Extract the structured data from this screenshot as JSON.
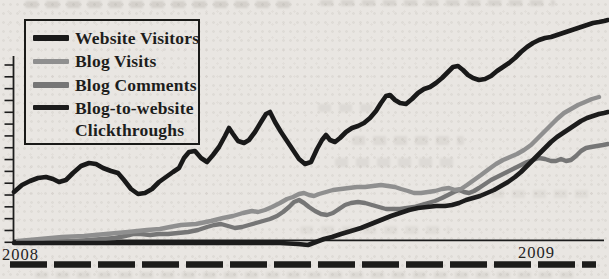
{
  "figure": {
    "kind": "scanned book line chart",
    "visible_text": [
      "Website Visitors",
      "Blog Visits",
      "Blog Comments",
      "Blog-to-website",
      "Clickthroughs",
      "2008",
      "2009"
    ]
  },
  "theme": {
    "paper_color": "#e9e6e2",
    "ink_color": "#1c1c1c",
    "gray_light": "#8f8f8f",
    "gray_dark": "#767676"
  },
  "legend": {
    "items": [
      {
        "label": "Website Visitors"
      },
      {
        "label": "Blog Visits"
      },
      {
        "label": "Blog Comments"
      },
      {
        "label": "Blog-to-website Clickthroughs",
        "line1": "Blog-to-website",
        "line2": "Clickthroughs"
      }
    ]
  },
  "x_axis_labels": {
    "left": "2008",
    "right": "2009"
  },
  "chart_data": {
    "type": "line",
    "title": "",
    "x_tick_labels": [
      "2008",
      "2009"
    ],
    "y_axis": {
      "numeric_labels_visible": false,
      "tick_count": 16
    },
    "legend_position": "top-left inside plot",
    "note": "No numeric scale is printed; series are digitized as [x,y] screen-pixel coordinates of the 609x279 scan (smaller y = higher value). All four series trend upward through 2008 into 2009.",
    "axes_px": {
      "y_axis": {
        "x": 13.5,
        "y_top": 56,
        "y_bottom": 241.5,
        "width": 1.8
      },
      "ticks": {
        "x1": 4.5,
        "x2": 13.5,
        "count": 16,
        "y_first": 65,
        "spacing": 11.82,
        "width": 1.6
      },
      "x_axis": {
        "y": 240.3,
        "x1": 13,
        "x2": 604,
        "width": 1.7
      }
    },
    "dashed_rule": {
      "y": 264.5,
      "x1": 10,
      "x2": 596,
      "dash": 37,
      "gap": 7,
      "width": 6.5,
      "color": "#1d1d1b"
    },
    "series": [
      {
        "name": "Blog Comments",
        "color": "#767676",
        "stroke_width": 4.4,
        "points": [
          [
            30,
            243
          ],
          [
            60,
            242
          ],
          [
            90,
            240
          ],
          [
            115,
            238
          ],
          [
            125,
            236
          ],
          [
            133,
            234
          ],
          [
            141,
            234
          ],
          [
            150,
            235
          ],
          [
            159,
            234
          ],
          [
            168,
            234
          ],
          [
            178,
            233
          ],
          [
            188,
            232
          ],
          [
            198,
            230
          ],
          [
            207,
            227
          ],
          [
            214,
            225
          ],
          [
            221,
            224
          ],
          [
            228,
            226
          ],
          [
            235,
            228
          ],
          [
            242,
            227
          ],
          [
            249,
            225
          ],
          [
            256,
            223
          ],
          [
            263,
            221
          ],
          [
            270,
            219
          ],
          [
            277,
            216
          ],
          [
            283,
            212
          ],
          [
            289,
            207
          ],
          [
            294,
            202
          ],
          [
            299,
            200
          ],
          [
            304,
            203
          ],
          [
            309,
            207
          ],
          [
            315,
            211
          ],
          [
            321,
            214
          ],
          [
            327,
            215
          ],
          [
            333,
            213
          ],
          [
            339,
            209
          ],
          [
            345,
            205
          ],
          [
            351,
            203
          ],
          [
            358,
            202
          ],
          [
            365,
            203
          ],
          [
            372,
            205
          ],
          [
            379,
            207
          ],
          [
            386,
            209
          ],
          [
            393,
            209
          ],
          [
            400,
            209
          ],
          [
            407,
            208
          ],
          [
            414,
            207
          ],
          [
            421,
            205
          ],
          [
            428,
            203
          ],
          [
            435,
            201
          ],
          [
            442,
            198
          ],
          [
            448,
            195
          ],
          [
            454,
            192
          ],
          [
            459,
            190
          ],
          [
            464,
            192
          ],
          [
            469,
            193
          ],
          [
            474,
            191
          ],
          [
            479,
            188
          ],
          [
            485,
            184
          ],
          [
            491,
            180
          ],
          [
            497,
            177
          ],
          [
            503,
            174
          ],
          [
            509,
            171
          ],
          [
            515,
            168
          ],
          [
            521,
            165
          ],
          [
            527,
            162
          ],
          [
            533,
            160
          ],
          [
            539,
            158
          ],
          [
            545,
            159
          ],
          [
            551,
            161
          ],
          [
            556,
            161
          ],
          [
            561,
            159
          ],
          [
            566,
            161
          ],
          [
            571,
            160
          ],
          [
            576,
            156
          ],
          [
            581,
            151
          ],
          [
            586,
            148
          ],
          [
            591,
            147
          ],
          [
            597,
            146
          ],
          [
            603,
            145
          ],
          [
            608,
            144
          ]
        ]
      },
      {
        "name": "Blog Visits",
        "color": "#8f8f8f",
        "stroke_width": 4.4,
        "points": [
          [
            18,
            241
          ],
          [
            40,
            239
          ],
          [
            62,
            237
          ],
          [
            84,
            236
          ],
          [
            106,
            234
          ],
          [
            128,
            232
          ],
          [
            147,
            230
          ],
          [
            160,
            229
          ],
          [
            170,
            227
          ],
          [
            181,
            225
          ],
          [
            196,
            224
          ],
          [
            211,
            221
          ],
          [
            223,
            218
          ],
          [
            233,
            216
          ],
          [
            243,
            213
          ],
          [
            252,
            211
          ],
          [
            258,
            212
          ],
          [
            265,
            210
          ],
          [
            272,
            207
          ],
          [
            280,
            203
          ],
          [
            287,
            199
          ],
          [
            293,
            197
          ],
          [
            299,
            194
          ],
          [
            304,
            193
          ],
          [
            309,
            195
          ],
          [
            314,
            196
          ],
          [
            319,
            194
          ],
          [
            326,
            192
          ],
          [
            333,
            190
          ],
          [
            341,
            189
          ],
          [
            349,
            188
          ],
          [
            357,
            187
          ],
          [
            365,
            187
          ],
          [
            373,
            186
          ],
          [
            381,
            185
          ],
          [
            388,
            186
          ],
          [
            395,
            187
          ],
          [
            401,
            189
          ],
          [
            408,
            191
          ],
          [
            414,
            193
          ],
          [
            421,
            193
          ],
          [
            428,
            192
          ],
          [
            435,
            191
          ],
          [
            442,
            189
          ],
          [
            449,
            188
          ],
          [
            455,
            190
          ],
          [
            461,
            189
          ],
          [
            467,
            185
          ],
          [
            474,
            180
          ],
          [
            481,
            175
          ],
          [
            489,
            169
          ],
          [
            496,
            164
          ],
          [
            503,
            160
          ],
          [
            510,
            157
          ],
          [
            517,
            154
          ],
          [
            524,
            150
          ],
          [
            531,
            145
          ],
          [
            537,
            139
          ],
          [
            544,
            132
          ],
          [
            551,
            125
          ],
          [
            557,
            119
          ],
          [
            564,
            113
          ],
          [
            571,
            109
          ],
          [
            578,
            105
          ],
          [
            585,
            102
          ],
          [
            592,
            99
          ],
          [
            599,
            97
          ]
        ]
      },
      {
        "name": "Blog-to-website Clickthroughs",
        "color": "#1c1c1c",
        "stroke_width": 4.6,
        "points": [
          [
            14,
            243
          ],
          [
            50,
            243
          ],
          [
            90,
            243
          ],
          [
            130,
            243
          ],
          [
            170,
            243
          ],
          [
            210,
            243
          ],
          [
            250,
            243
          ],
          [
            280,
            243
          ],
          [
            298,
            244
          ],
          [
            308,
            245
          ],
          [
            316,
            242
          ],
          [
            324,
            239
          ],
          [
            332,
            237
          ],
          [
            341,
            234
          ],
          [
            351,
            231
          ],
          [
            361,
            228
          ],
          [
            371,
            224
          ],
          [
            381,
            220
          ],
          [
            391,
            216
          ],
          [
            400,
            213
          ],
          [
            409,
            210
          ],
          [
            418,
            208
          ],
          [
            427,
            207
          ],
          [
            436,
            206
          ],
          [
            445,
            206
          ],
          [
            452,
            205
          ],
          [
            459,
            203
          ],
          [
            466,
            200
          ],
          [
            473,
            198
          ],
          [
            480,
            196
          ],
          [
            487,
            193
          ],
          [
            494,
            190
          ],
          [
            501,
            186
          ],
          [
            508,
            182
          ],
          [
            515,
            177
          ],
          [
            521,
            172
          ],
          [
            527,
            166
          ],
          [
            533,
            160
          ],
          [
            539,
            154
          ],
          [
            545,
            148
          ],
          [
            551,
            142
          ],
          [
            557,
            137
          ],
          [
            563,
            133
          ],
          [
            569,
            129
          ],
          [
            575,
            125
          ],
          [
            581,
            121
          ],
          [
            587,
            118
          ],
          [
            593,
            116
          ],
          [
            599,
            114
          ],
          [
            604,
            113
          ],
          [
            608,
            112
          ]
        ]
      },
      {
        "name": "Website Visitors",
        "color": "#191919",
        "stroke_width": 4.6,
        "points": [
          [
            14,
            192
          ],
          [
            22,
            185
          ],
          [
            30,
            181
          ],
          [
            38,
            178
          ],
          [
            46,
            177
          ],
          [
            53,
            179
          ],
          [
            59,
            182
          ],
          [
            66,
            180
          ],
          [
            73,
            173
          ],
          [
            81,
            166
          ],
          [
            89,
            163
          ],
          [
            96,
            164
          ],
          [
            103,
            168
          ],
          [
            111,
            171
          ],
          [
            118,
            173
          ],
          [
            124,
            180
          ],
          [
            131,
            189
          ],
          [
            138,
            194
          ],
          [
            145,
            193
          ],
          [
            152,
            189
          ],
          [
            159,
            182
          ],
          [
            166,
            177
          ],
          [
            173,
            172
          ],
          [
            179,
            168
          ],
          [
            184,
            158
          ],
          [
            189,
            152
          ],
          [
            195,
            151
          ],
          [
            201,
            158
          ],
          [
            207,
            162
          ],
          [
            213,
            155
          ],
          [
            219,
            147
          ],
          [
            225,
            136
          ],
          [
            229,
            128
          ],
          [
            233,
            134
          ],
          [
            238,
            141
          ],
          [
            244,
            143
          ],
          [
            249,
            140
          ],
          [
            255,
            132
          ],
          [
            261,
            122
          ],
          [
            266,
            114
          ],
          [
            270,
            112
          ],
          [
            275,
            122
          ],
          [
            281,
            132
          ],
          [
            287,
            141
          ],
          [
            293,
            150
          ],
          [
            299,
            159
          ],
          [
            305,
            164
          ],
          [
            311,
            162
          ],
          [
            317,
            149
          ],
          [
            322,
            140
          ],
          [
            326,
            135
          ],
          [
            330,
            140
          ],
          [
            335,
            142
          ],
          [
            340,
            138
          ],
          [
            346,
            132
          ],
          [
            352,
            128
          ],
          [
            358,
            126
          ],
          [
            364,
            123
          ],
          [
            370,
            118
          ],
          [
            376,
            111
          ],
          [
            381,
            103
          ],
          [
            386,
            96
          ],
          [
            390,
            95
          ],
          [
            395,
            100
          ],
          [
            400,
            103
          ],
          [
            406,
            104
          ],
          [
            412,
            99
          ],
          [
            418,
            93
          ],
          [
            424,
            89
          ],
          [
            430,
            87
          ],
          [
            436,
            83
          ],
          [
            442,
            78
          ],
          [
            448,
            72
          ],
          [
            453,
            67
          ],
          [
            458,
            66
          ],
          [
            463,
            70
          ],
          [
            468,
            75
          ],
          [
            473,
            78
          ],
          [
            479,
            80
          ],
          [
            485,
            79
          ],
          [
            491,
            76
          ],
          [
            497,
            71
          ],
          [
            503,
            67
          ],
          [
            509,
            63
          ],
          [
            515,
            58
          ],
          [
            521,
            52
          ],
          [
            527,
            47
          ],
          [
            533,
            43
          ],
          [
            539,
            40
          ],
          [
            545,
            38
          ],
          [
            551,
            37
          ],
          [
            557,
            35
          ],
          [
            563,
            33
          ],
          [
            569,
            31
          ],
          [
            575,
            29
          ],
          [
            581,
            27
          ],
          [
            587,
            25
          ],
          [
            593,
            23
          ],
          [
            599,
            22
          ],
          [
            604,
            21
          ],
          [
            608,
            20
          ]
        ]
      }
    ]
  }
}
